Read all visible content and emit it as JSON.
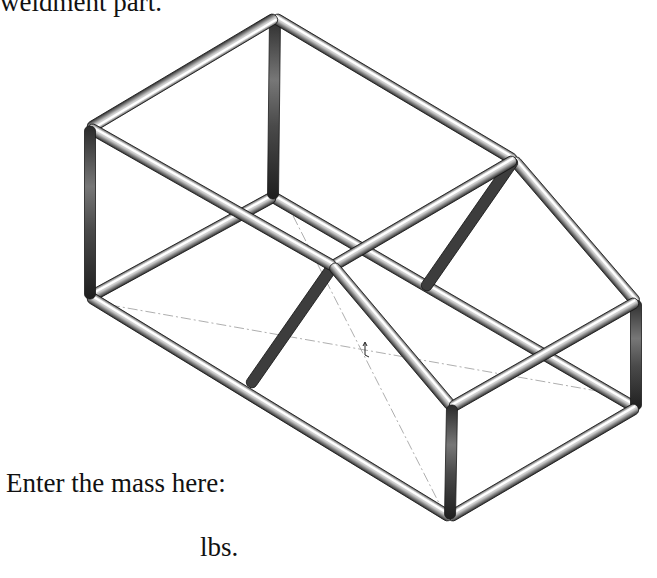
{
  "document": {
    "top_text": "weldment part.",
    "prompt": "Enter the mass here:",
    "answer": {
      "value": "",
      "placeholder": "",
      "unit": "lbs."
    }
  },
  "figure": {
    "colors": {
      "tube_light": "#f2f2f2",
      "tube_mid": "#b8b8b8",
      "tube_dark": "#3a3a3a",
      "centerline": "#999999",
      "background": "#ffffff"
    },
    "tube_width": 11,
    "members": [
      {
        "id": "top-left-rail",
        "from": [
          275,
          18
        ],
        "to": [
          90,
          128
        ]
      },
      {
        "id": "top-back-rail",
        "from": [
          275,
          18
        ],
        "to": [
          514,
          160
        ]
      },
      {
        "id": "top-front-rail",
        "from": [
          90,
          128
        ],
        "to": [
          333,
          266
        ]
      },
      {
        "id": "ridge-rail",
        "from": [
          333,
          266
        ],
        "to": [
          514,
          160
        ]
      },
      {
        "id": "front-slope-rail",
        "from": [
          333,
          266
        ],
        "to": [
          452,
          407
        ]
      },
      {
        "id": "back-slope-rail",
        "from": [
          514,
          160
        ],
        "to": [
          636,
          302
        ]
      },
      {
        "id": "right-top-rail",
        "from": [
          452,
          407
        ],
        "to": [
          636,
          302
        ]
      },
      {
        "id": "bottom-left-rail",
        "from": [
          90,
          297
        ],
        "to": [
          273,
          197
        ]
      },
      {
        "id": "bottom-front-rail",
        "from": [
          90,
          297
        ],
        "to": [
          450,
          517
        ]
      },
      {
        "id": "bottom-back-rail",
        "from": [
          273,
          197
        ],
        "to": [
          636,
          408
        ]
      },
      {
        "id": "bottom-right-rail",
        "from": [
          450,
          517
        ],
        "to": [
          636,
          408
        ]
      },
      {
        "id": "front-brace",
        "from": [
          333,
          266
        ],
        "to": [
          250,
          385
        ],
        "dark": true
      },
      {
        "id": "back-brace",
        "from": [
          514,
          160
        ],
        "to": [
          425,
          288
        ],
        "dark": true
      }
    ],
    "posts": [
      {
        "id": "post-front-left",
        "from": [
          90,
          128
        ],
        "to": [
          90,
          297
        ]
      },
      {
        "id": "post-back-left",
        "from": [
          275,
          18
        ],
        "to": [
          273,
          197
        ]
      },
      {
        "id": "post-front-right",
        "from": [
          452,
          407
        ],
        "to": [
          450,
          517
        ]
      },
      {
        "id": "post-back-right",
        "from": [
          636,
          302
        ],
        "to": [
          636,
          408
        ]
      }
    ],
    "centerlines": [
      {
        "from": [
          110,
          305
        ],
        "to": [
          620,
          395
        ]
      },
      {
        "from": [
          285,
          200
        ],
        "to": [
          440,
          505
        ]
      }
    ],
    "origin_triad": {
      "x": 365,
      "y": 355
    }
  }
}
